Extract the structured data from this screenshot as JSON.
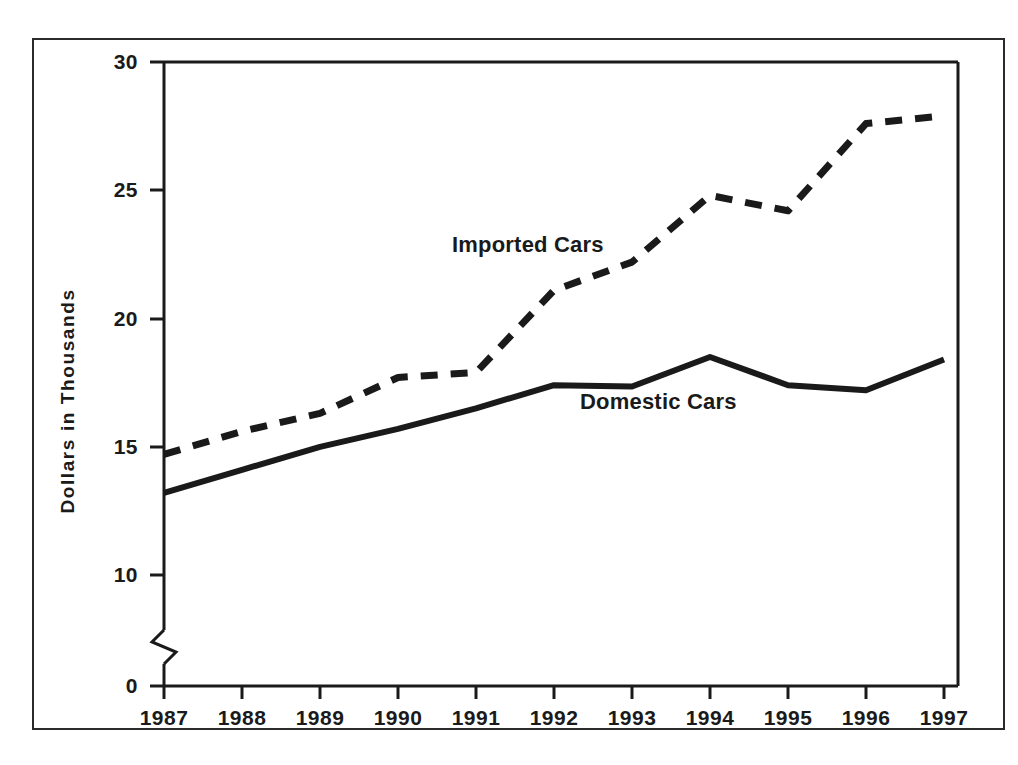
{
  "chart_data": {
    "type": "line",
    "title": "",
    "xlabel": "",
    "ylabel": "Dollars in Thousands",
    "categories": [
      "1987",
      "1988",
      "1989",
      "1990",
      "1991",
      "1992",
      "1993",
      "1994",
      "1995",
      "1996",
      "1997"
    ],
    "x": [
      1987,
      1988,
      1989,
      1990,
      1991,
      1992,
      1993,
      1994,
      1995,
      1996,
      1997
    ],
    "ylim": [
      0,
      30
    ],
    "yticks": [
      0,
      10,
      15,
      20,
      25,
      30
    ],
    "ytick_labels": [
      "0",
      "10",
      "15",
      "20",
      "25",
      "30"
    ],
    "axis_break": true,
    "axis_break_between": [
      0,
      10
    ],
    "grid": false,
    "legend_position": "inline-annotation",
    "series": [
      {
        "name": "Imported Cars",
        "style": "dashed",
        "color": "#1a1a1a",
        "values": [
          14.7,
          15.6,
          16.3,
          17.7,
          17.9,
          21.1,
          22.2,
          24.8,
          24.2,
          27.6,
          27.9
        ]
      },
      {
        "name": "Domestic Cars",
        "style": "solid",
        "color": "#1a1a1a",
        "values": [
          13.2,
          14.1,
          15.0,
          15.7,
          16.5,
          17.4,
          17.35,
          18.5,
          17.4,
          17.2,
          18.4
        ]
      }
    ],
    "annotations": [
      {
        "text": "Imported Cars",
        "series": "Imported Cars"
      },
      {
        "text": "Domestic Cars",
        "series": "Domestic Cars"
      }
    ]
  },
  "axis": {
    "y_title": "Dollars in Thousands",
    "y_tick_labels": [
      "30",
      "25",
      "20",
      "15",
      "10",
      "0"
    ],
    "x_tick_labels": [
      "1987",
      "1988",
      "1989",
      "1990",
      "1991",
      "1992",
      "1993",
      "1994",
      "1995",
      "1996",
      "1997"
    ]
  },
  "labels": {
    "imported": "Imported Cars",
    "domestic": "Domestic Cars"
  },
  "colors": {
    "ink": "#1a1a1a",
    "frame": "#2b2b2b",
    "background": "#ffffff"
  }
}
